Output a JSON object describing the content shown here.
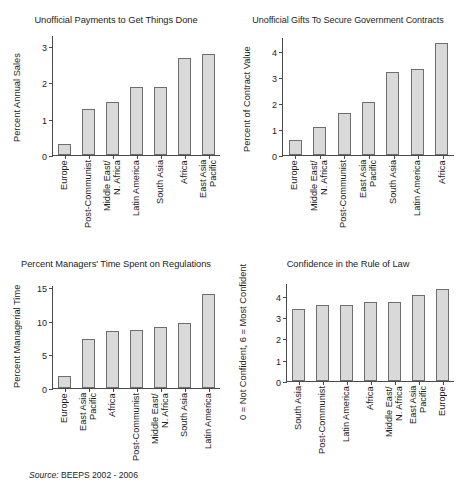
{
  "source_note": {
    "prefix": "Source:",
    "text": " BEEPS 2002 - 2006"
  },
  "chart_data": [
    {
      "type": "bar",
      "title": "Unofficial Payments to Get Things Done",
      "ylabel": "Percent Annual Sales",
      "xlabel": "",
      "categories": [
        "Europe",
        "Post-Communist",
        "Middle East/\nN. Africa",
        "Latin America",
        "South Asia",
        "Africa",
        "East Asia\nPacific"
      ],
      "values": [
        0.3,
        1.27,
        1.45,
        1.87,
        1.88,
        2.68,
        2.78
      ],
      "yticks": [
        0,
        1,
        2,
        3
      ],
      "ylim": [
        0,
        3.3
      ],
      "grid": false,
      "legend": "none"
    },
    {
      "type": "bar",
      "title": "Unofficial Gifts To Secure Government Contracts",
      "ylabel": "Percent of Contract Value",
      "xlabel": "",
      "categories": [
        "Europe",
        "Middle East/\nN. Africa",
        "Post-Communist",
        "East Asia\nPacific",
        "South Asia",
        "Latin America",
        "Africa"
      ],
      "values": [
        0.57,
        1.08,
        1.62,
        2.03,
        3.2,
        3.3,
        4.3
      ],
      "yticks": [
        0,
        1,
        2,
        3,
        4
      ],
      "ylim": [
        0,
        4.55
      ],
      "grid": false,
      "legend": "none"
    },
    {
      "type": "bar",
      "title": "Percent Managers' Time Spent on Regulations",
      "ylabel": "Percent Managerial Time",
      "xlabel": "",
      "categories": [
        "Europe",
        "East Asia\nPacific",
        "Africa",
        "Post-Communist",
        "Middle East/\nN. Africa",
        "South Asia",
        "Latin America"
      ],
      "values": [
        1.8,
        7.3,
        8.5,
        8.6,
        9.1,
        9.7,
        13.9
      ],
      "yticks": [
        0,
        5,
        10,
        15
      ],
      "ylim": [
        0,
        15.3
      ],
      "grid": false,
      "legend": "none"
    },
    {
      "type": "bar",
      "title": "Confidence in the Rule of Law",
      "ylabel": "0 = Not Confident, 6 = Most Confident",
      "xlabel": "",
      "categories": [
        "South Asia",
        "Post-Communist",
        "Latin America",
        "Africa",
        "Middle East/\nN. Africa",
        "East Asia\nPacific",
        "Europe"
      ],
      "values": [
        3.4,
        3.57,
        3.55,
        3.73,
        3.73,
        4.05,
        4.33
      ],
      "yticks": [
        0,
        1,
        2,
        3,
        4
      ],
      "ylim": [
        0,
        4.6
      ],
      "grid": false,
      "legend": "none"
    }
  ]
}
